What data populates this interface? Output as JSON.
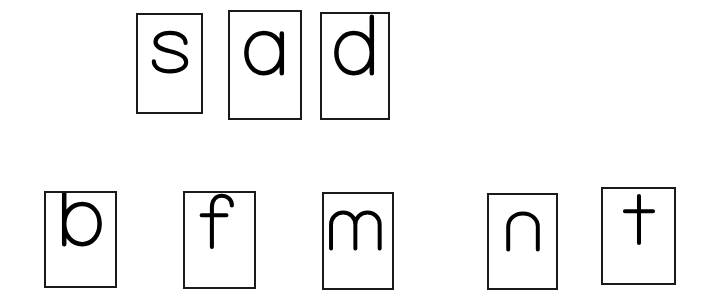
{
  "worksheet": {
    "title": "Lowercase letter flashcards",
    "background_color": "#ffffff",
    "card_border_color": "#1a1a1a",
    "letter_color": "#000000",
    "rows": [
      {
        "name": "top-row",
        "cards": [
          {
            "letter": "s",
            "x": 136,
            "y": 13,
            "width": 67,
            "height": 101,
            "glyph": "s"
          },
          {
            "letter": "a",
            "x": 228,
            "y": 10,
            "width": 74,
            "height": 110,
            "glyph": "a"
          },
          {
            "letter": "d",
            "x": 320,
            "y": 12,
            "width": 70,
            "height": 108,
            "glyph": "d"
          }
        ]
      },
      {
        "name": "bottom-row",
        "cards": [
          {
            "letter": "b",
            "x": 44,
            "y": 191,
            "width": 73,
            "height": 97,
            "glyph": "b"
          },
          {
            "letter": "f",
            "x": 183,
            "y": 191,
            "width": 73,
            "height": 98,
            "glyph": "f"
          },
          {
            "letter": "m",
            "x": 322,
            "y": 192,
            "width": 72,
            "height": 98,
            "glyph": "m"
          },
          {
            "letter": "n",
            "x": 487,
            "y": 193,
            "width": 71,
            "height": 97,
            "glyph": "n"
          },
          {
            "letter": "t",
            "x": 601,
            "y": 187,
            "width": 75,
            "height": 98,
            "glyph": "t"
          }
        ]
      }
    ]
  }
}
